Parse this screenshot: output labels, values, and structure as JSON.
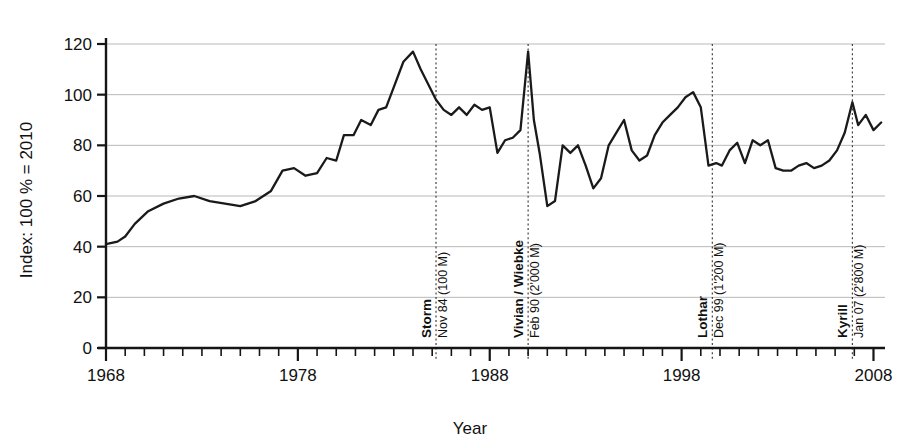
{
  "chart_data": {
    "type": "line",
    "title": "",
    "xlabel": "Year",
    "ylabel": "Index: 100 % = 2010",
    "xlim": [
      1968,
      2008.6
    ],
    "ylim": [
      0,
      125
    ],
    "xticks": [
      1968,
      1978,
      1988,
      1998,
      2008
    ],
    "xtick_labels": [
      "1968",
      "1978",
      "1988",
      "1998",
      "2008"
    ],
    "yticks": [
      0,
      20,
      40,
      60,
      80,
      100,
      120
    ],
    "ytick_labels": [
      "0",
      "20",
      "40",
      "60",
      "80",
      "100",
      "120"
    ],
    "minor_x_tick_interval": 1,
    "grid": "horizontal",
    "legend": "none",
    "series": [
      {
        "name": "Index",
        "x": [
          1968.0,
          1968.6,
          1969.0,
          1969.5,
          1970.2,
          1971.0,
          1971.8,
          1972.6,
          1973.4,
          1974.2,
          1975.0,
          1975.8,
          1976.6,
          1977.2,
          1977.8,
          1978.4,
          1979.0,
          1979.5,
          1980.0,
          1980.4,
          1980.9,
          1981.3,
          1981.8,
          1982.2,
          1982.6,
          1983.0,
          1983.5,
          1984.0,
          1984.4,
          1984.8,
          1985.2,
          1985.6,
          1986.0,
          1986.4,
          1986.8,
          1987.2,
          1987.6,
          1988.0,
          1988.4,
          1988.8,
          1989.2,
          1989.6,
          1990.0,
          1990.3,
          1990.6,
          1991.0,
          1991.4,
          1991.8,
          1992.2,
          1992.6,
          1993.0,
          1993.4,
          1993.8,
          1994.2,
          1994.6,
          1995.0,
          1995.4,
          1995.8,
          1996.2,
          1996.6,
          1997.0,
          1997.4,
          1997.8,
          1998.2,
          1998.6,
          1999.0,
          1999.4,
          1999.8,
          2000.1,
          2000.5,
          2000.9,
          2001.3,
          2001.7,
          2002.1,
          2002.5,
          2002.9,
          2003.3,
          2003.7,
          2004.1,
          2004.5,
          2004.9,
          2005.3,
          2005.7,
          2006.1,
          2006.5,
          2006.9,
          2007.2,
          2007.6,
          2008.0,
          2008.4
        ],
        "y": [
          41,
          42,
          44,
          49,
          54,
          57,
          59,
          60,
          58,
          57,
          56,
          58,
          62,
          70,
          71,
          68,
          69,
          75,
          74,
          84,
          84,
          90,
          88,
          94,
          95,
          103,
          113,
          117,
          110,
          104,
          98,
          94,
          92,
          95,
          92,
          96,
          94,
          95,
          77,
          82,
          83,
          86,
          117,
          90,
          77,
          56,
          58,
          80,
          77,
          80,
          72,
          63,
          67,
          80,
          85,
          90,
          78,
          74,
          76,
          84,
          89,
          92,
          95,
          99,
          101,
          95,
          72,
          73,
          72,
          78,
          81,
          73,
          82,
          80,
          82,
          71,
          70,
          70,
          72,
          73,
          71,
          72,
          74,
          78,
          85,
          97,
          88,
          92,
          86,
          89
        ]
      }
    ],
    "events": [
      {
        "x": 1985.2,
        "name": "Storm",
        "detail": "Nov 84 (100 M)"
      },
      {
        "x": 1990.0,
        "name": "Vivian / Wiebke",
        "detail": "Feb 90 (2'000 M)"
      },
      {
        "x": 1999.6,
        "name": "Lothar",
        "detail": "Dec 99 (1'200 M)"
      },
      {
        "x": 2006.9,
        "name": "Kyrill",
        "detail": "Jan 07 (2'800 M)"
      }
    ],
    "colors": {
      "line": "#1a1a1a",
      "grid": "#b9b9b9",
      "axis": "#151515",
      "event": "#3a3a3a",
      "background": "#ffffff"
    }
  }
}
